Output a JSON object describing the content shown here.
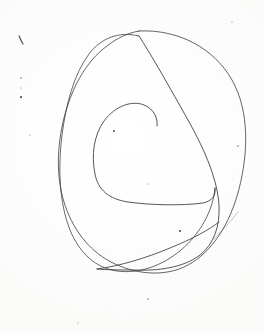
{
  "image": {
    "kind": "scanned-handwriting",
    "subject": "hand-drawn continuous spiral scribble",
    "alt_text": "A single continuous pen line drawn as a loose spiral: a large rounded outer oval, a second overlapping oval crossing it near the top and lower-left, and an inner open coil whose free end stops near the middle; a faint thin tail exits to the lower right.",
    "width_px": 264,
    "height_px": 333,
    "background_color": "#fdfdfc",
    "ink_color": "#3b3739",
    "paper_color": "#fefefe"
  },
  "strokes": [
    {
      "id": "outer-oval",
      "name": "outer-oval-stroke",
      "description": "Largest rounded oval forming the outer boundary of the spiral",
      "stroke_width": 0.85,
      "opacity": 0.92,
      "path": "M 139 31 C 178 29 214 48 232 80 C 250 112 248 154 239 189 C 230 224 212 252 188 265 C 164 278 134 274 111 262 C 88 250 72 228 64 202 C 56 176 57 146 64 118 C 71 90 85 62 107 46 C 117 38 128 33 139 31 Z"
    },
    {
      "id": "second-oval",
      "name": "second-oval-stroke",
      "description": "Second oval tilted left, crossing the outer oval near the top and at the lower-left",
      "stroke_width": 0.85,
      "opacity": 0.9,
      "path": "M 139 36 C 119 31 101 38 89 54 C 74 74 66 104 62 135 C 58 168 59 202 70 230 C 80 254 96 268 117 271 C 139 274 162 266 181 250 C 200 234 213 211 215 188"
    },
    {
      "id": "diagonal-sweep",
      "name": "diagonal-sweep-stroke",
      "description": "Long diagonal line running from the top crossing down to the lower right, then curving left along the bottom",
      "stroke_width": 0.9,
      "opacity": 0.95,
      "path": "M 139 36 C 152 56 170 88 188 120 C 206 152 218 182 219 206 C 220 226 214 244 200 255 C 183 268 157 271 135 270 C 121 270 108 270 97 269"
    },
    {
      "id": "inner-coil",
      "name": "inner-coil-stroke",
      "description": "Inner open coil; starts at the lower-left of the inner loop, sweeps around and ends free near the center-right",
      "stroke_width": 0.9,
      "opacity": 0.95,
      "path": "M 215 188 C 216 196 212 201 203 203 C 180 206 150 205 128 202 C 109 199 98 190 95 174 C 91 155 94 135 104 121 C 115 106 132 100 144 105 C 154 109 158 118 157 126"
    },
    {
      "id": "bottom-swoop",
      "name": "bottom-swoop-stroke",
      "description": "Shallow line across the bottom sweeping up to the right toward the crossing",
      "stroke_width": 0.9,
      "opacity": 0.92,
      "path": "M 97 269 C 120 266 146 258 170 248 C 192 239 209 230 219 222"
    },
    {
      "id": "exit-tail",
      "name": "exit-tail-stroke",
      "description": "Faint thin tail leaving the lower-right crossing and trailing up to the right",
      "stroke_width": 0.7,
      "opacity": 0.42,
      "path": "M 214 239 C 222 231 230 222 238 212"
    },
    {
      "id": "tick-mark",
      "name": "tick-mark-stroke",
      "description": "Small isolated diagonal pen tick at the upper left of the page",
      "stroke_width": 1.3,
      "opacity": 0.85,
      "path": "M 19 36 C 20 38 21 41 23 44"
    }
  ],
  "specks": [
    {
      "name": "ink-speck",
      "x": 21,
      "y": 78,
      "size": 1.4,
      "tone": "faint"
    },
    {
      "name": "ink-speck",
      "x": 21,
      "y": 88,
      "size": 1.2,
      "tone": "veryfaint"
    },
    {
      "name": "ink-speck",
      "x": 21,
      "y": 97,
      "size": 1.7,
      "tone": "normal"
    },
    {
      "name": "ink-speck",
      "x": 114,
      "y": 131,
      "size": 1.9,
      "tone": "normal"
    },
    {
      "name": "ink-speck",
      "x": 180,
      "y": 231,
      "size": 1.6,
      "tone": "normal"
    },
    {
      "name": "ink-speck",
      "x": 238,
      "y": 146,
      "size": 1.3,
      "tone": "faint"
    },
    {
      "name": "ink-speck",
      "x": 30,
      "y": 135,
      "size": 1.2,
      "tone": "veryfaint"
    },
    {
      "name": "ink-speck",
      "x": 148,
      "y": 184,
      "size": 1.1,
      "tone": "veryfaint"
    },
    {
      "name": "ink-speck",
      "x": 148,
      "y": 299,
      "size": 1.4,
      "tone": "faint"
    },
    {
      "name": "ink-speck",
      "x": 78,
      "y": 323,
      "size": 1.2,
      "tone": "veryfaint"
    },
    {
      "name": "ink-speck",
      "x": 232,
      "y": 22,
      "size": 1.2,
      "tone": "veryfaint"
    },
    {
      "name": "ink-speck",
      "x": 105,
      "y": 310,
      "size": 1.0,
      "tone": "veryfaint"
    }
  ]
}
